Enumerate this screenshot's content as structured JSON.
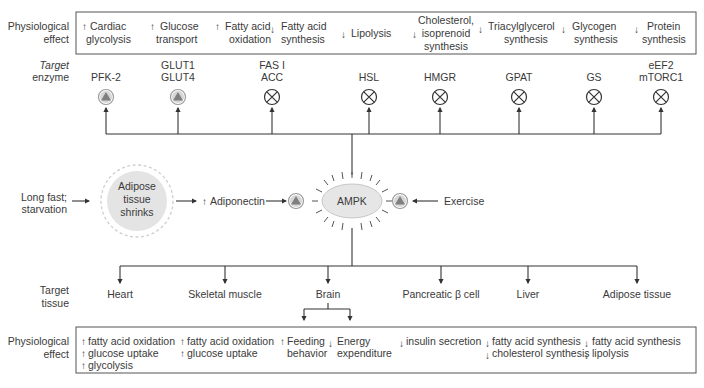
{
  "top": {
    "row_label_line1": "Physiological",
    "row_label_line2": "effect",
    "effects": [
      {
        "dir": "up",
        "lines": [
          "Cardiac",
          "glycolysis"
        ]
      },
      {
        "dir": "up",
        "lines": [
          "Glucose",
          "transport"
        ]
      },
      {
        "dir": "up",
        "lines": [
          "Fatty acid",
          "oxidation"
        ]
      },
      {
        "dir": "down",
        "lines": [
          "Fatty acid",
          "synthesis"
        ]
      },
      {
        "dir": "down",
        "lines": [
          "Lipolysis"
        ]
      },
      {
        "dir": "down",
        "lines": [
          "Cholesterol,",
          "isoprenoid",
          "synthesis"
        ]
      },
      {
        "dir": "down",
        "lines": [
          "Triacylglycerol",
          "synthesis"
        ]
      },
      {
        "dir": "down",
        "lines": [
          "Glycogen",
          "synthesis"
        ]
      },
      {
        "dir": "down",
        "lines": [
          "Protein",
          "synthesis"
        ]
      }
    ]
  },
  "enzymes": {
    "row_label_line1": "Target",
    "row_label_line2": "enzyme",
    "items": [
      {
        "lines": [
          "PFK-2"
        ],
        "effect": "activate"
      },
      {
        "lines": [
          "GLUT1",
          "GLUT4"
        ],
        "effect": "activate"
      },
      {
        "lines": [
          "FAS I",
          "ACC"
        ],
        "effect": "inhibit"
      },
      {
        "lines": [
          "HSL"
        ],
        "effect": "inhibit"
      },
      {
        "lines": [
          "HMGR"
        ],
        "effect": "inhibit"
      },
      {
        "lines": [
          "GPAT"
        ],
        "effect": "inhibit"
      },
      {
        "lines": [
          "GS"
        ],
        "effect": "inhibit"
      },
      {
        "lines": [
          "eEF2",
          "mTORC1"
        ],
        "effect": "inhibit"
      }
    ]
  },
  "middle": {
    "trigger_line1": "Long fast;",
    "trigger_line2": "starvation",
    "adipose_line1": "Adipose",
    "adipose_line2": "tissue",
    "adipose_line3": "shrinks",
    "adiponectin_arrow": "↑",
    "adiponectin": "Adiponectin",
    "center": "AMPK",
    "exercise": "Exercise"
  },
  "tissues": {
    "row_label_line1": "Target",
    "row_label_line2": "tissue",
    "items": [
      "Heart",
      "Skeletal muscle",
      "Brain",
      "Pancreatic β cell",
      "Liver",
      "Adipose tissue"
    ]
  },
  "bottom": {
    "row_label_line1": "Physiological",
    "row_label_line2": "effect",
    "groups": [
      {
        "items": [
          {
            "dir": "up",
            "text": "fatty acid oxidation"
          },
          {
            "dir": "up",
            "text": "glucose uptake"
          },
          {
            "dir": "up",
            "text": "glycolysis"
          }
        ]
      },
      {
        "items": [
          {
            "dir": "up",
            "text": "fatty acid oxidation"
          },
          {
            "dir": "up",
            "text": "glucose uptake"
          }
        ]
      },
      {
        "items": [
          {
            "dir": "up",
            "text": "Feeding",
            "text2": "behavior"
          }
        ]
      },
      {
        "items": [
          {
            "dir": "down",
            "text": "Energy",
            "text2": "expenditure"
          }
        ]
      },
      {
        "items": [
          {
            "dir": "down",
            "text": "insulin secretion"
          }
        ]
      },
      {
        "items": [
          {
            "dir": "down",
            "text": "fatty acid synthesis"
          },
          {
            "dir": "down",
            "text": "cholesterol synthesis"
          }
        ]
      },
      {
        "items": [
          {
            "dir": "down",
            "text": "fatty acid synthesis"
          },
          {
            "dir": "down",
            "text": "lipolysis"
          }
        ]
      }
    ]
  },
  "colors": {
    "line": "#333333",
    "activate_fill": "#8a8a8a",
    "activate_ring": "#cfcfcf",
    "ampk_fill": "#e6e6e6",
    "adipose_fill": "#e4e4e4"
  }
}
